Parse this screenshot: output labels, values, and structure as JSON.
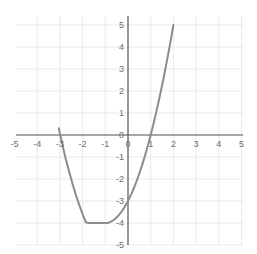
{
  "chart_data": {
    "type": "line",
    "title": "",
    "subtitle": "",
    "xlabel": "",
    "ylabel": "",
    "xlim": [
      -5,
      5
    ],
    "ylim": [
      -5,
      5
    ],
    "grid": true,
    "legend": null,
    "x_ticks": [
      -5,
      -4,
      -3,
      -2,
      -1,
      0,
      1,
      2,
      3,
      4,
      5
    ],
    "y_ticks": [
      -5,
      -4,
      -3,
      -2,
      -1,
      0,
      1,
      2,
      3,
      4,
      5
    ],
    "x_tick_labels": [
      "-5",
      "-4",
      "-3",
      "-2",
      "-1",
      "0",
      "1",
      "2",
      "3",
      "4",
      "5"
    ],
    "y_tick_labels": [
      "-5",
      "-4",
      "-3",
      "-2",
      "-1",
      "0",
      "1",
      "2",
      "3",
      "4",
      "5"
    ],
    "series": [
      {
        "name": "y = x^2 + 2x - 3",
        "kind": "parabola",
        "equation": "y = x^2 + 2x - 3",
        "vertex": [
          -1,
          -4
        ],
        "roots": [
          -3,
          1
        ],
        "y_intercept": -3,
        "color": "#8c8c8c",
        "line_width": 2,
        "x": [
          -3.05,
          -2.9,
          -2.75,
          -2.6,
          -2.45,
          -2.3,
          -2.15,
          -2.0,
          -1.85,
          -1.7,
          -1.55,
          -1.4,
          -1.25,
          -1.1,
          -1.0,
          -0.9,
          -0.75,
          -0.6,
          -0.45,
          -0.3,
          -0.15,
          0.0,
          0.15,
          0.3,
          0.45,
          0.6,
          0.75,
          0.9,
          1.0,
          1.1,
          1.25,
          1.4,
          1.55,
          1.7,
          1.85,
          2.0,
          2.15
        ],
        "y": [
          0.3025,
          -0.39,
          -1.0625,
          -1.64,
          -2.1975,
          -2.71,
          -3.1775,
          -3.6,
          -3.9775,
          -4.0,
          -4.0,
          -4.0,
          -4.0,
          -4.0,
          -4.0,
          -4.0,
          -3.9375,
          -3.84,
          -3.6975,
          -3.51,
          -3.2775,
          -3.0,
          -2.6775,
          -2.31,
          -1.8975,
          -1.44,
          -0.9375,
          -0.39,
          0.0,
          0.41,
          1.0625,
          1.76,
          2.5025,
          3.29,
          4.1225,
          5.0,
          5.9225
        ]
      }
    ]
  },
  "axes": {
    "x_axis_color": "#595959",
    "y_axis_color": "#595959",
    "grid_color": "#e9e9ef",
    "background": "#ffffff",
    "tick_label_color": "#6d6d6d"
  }
}
